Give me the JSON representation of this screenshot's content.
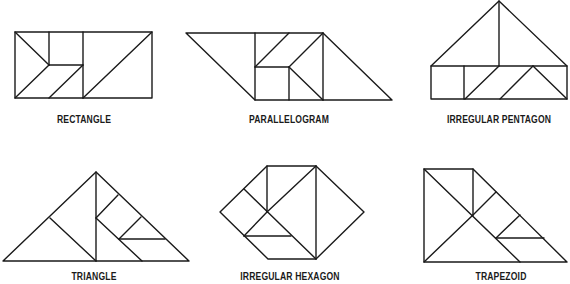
{
  "figure": {
    "shapes": [
      {
        "name": "Rectangle",
        "label": "RECTANGLE"
      },
      {
        "name": "Parallelogram",
        "label": "PARALLELOGRAM"
      },
      {
        "name": "Irregular Pentagon",
        "label": "IRREGULAR PENTAGON"
      },
      {
        "name": "Triangle",
        "label": "TRIANGLE"
      },
      {
        "name": "Irregular Hexagon",
        "label": "IRREGULAR HEXAGON"
      },
      {
        "name": "Trapezoid",
        "label": "TRAPEZOID"
      }
    ],
    "line_color": "#1a1a1a",
    "background": "#ffffff"
  }
}
